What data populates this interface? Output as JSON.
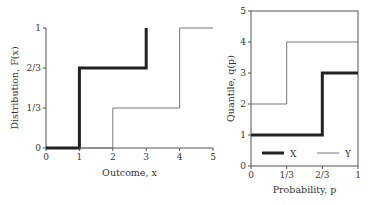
{
  "chart_data": [
    {
      "type": "line",
      "step": true,
      "title": "",
      "xlabel": "Outcome, x",
      "ylabel": "Distribution, F(x)",
      "xlim": [
        0,
        5
      ],
      "ylim": [
        0,
        1
      ],
      "xticks": [
        "0",
        "1",
        "2",
        "3",
        "4",
        "5"
      ],
      "xtick_values": [
        0,
        1,
        2,
        3,
        4,
        5
      ],
      "yticks": [
        "0",
        "1/3",
        "2/3",
        "1"
      ],
      "ytick_values": [
        0,
        0.3333,
        0.6667,
        1
      ],
      "grid": false,
      "series": [
        {
          "name": "X",
          "style": "thick",
          "x": [
            0,
            1,
            1,
            3,
            3
          ],
          "y": [
            0,
            0,
            0.6667,
            0.6667,
            1
          ]
        },
        {
          "name": "Y",
          "style": "thin",
          "x": [
            1,
            2,
            2,
            4,
            4,
            5
          ],
          "y": [
            0,
            0,
            0.3333,
            0.3333,
            1,
            1
          ]
        }
      ]
    },
    {
      "type": "line",
      "step": true,
      "title": "",
      "xlabel": "Probability, p",
      "ylabel": "Quantile, q(p)",
      "xlim": [
        0,
        1
      ],
      "ylim": [
        0,
        5
      ],
      "xticks": [
        "0",
        "1/3",
        "2/3",
        "1"
      ],
      "xtick_values": [
        0,
        0.3333,
        0.6667,
        1
      ],
      "yticks": [
        "0",
        "1",
        "2",
        "3",
        "4",
        "5"
      ],
      "ytick_values": [
        0,
        1,
        2,
        3,
        4,
        5
      ],
      "grid": false,
      "legend": {
        "placement": "bottom",
        "entries": [
          "X",
          "Y"
        ]
      },
      "series": [
        {
          "name": "X",
          "style": "thick",
          "x": [
            0,
            0.6667,
            0.6667,
            1
          ],
          "y": [
            1,
            1,
            3,
            3
          ]
        },
        {
          "name": "Y",
          "style": "thin",
          "x": [
            0,
            0.3333,
            0.3333,
            1
          ],
          "y": [
            2,
            2,
            4,
            4
          ]
        }
      ]
    }
  ],
  "colors": {
    "axis": "#555555",
    "thick": "#222222",
    "thin": "#777777"
  }
}
